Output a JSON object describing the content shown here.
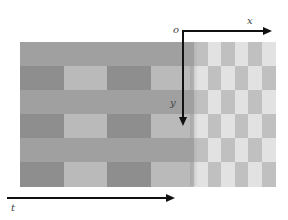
{
  "diagram": {
    "labels": {
      "origin": "o",
      "x_axis": "x",
      "y_axis": "y",
      "time_axis": "t"
    },
    "colors": {
      "stripe_mid": "#a0a0a0",
      "block_dark": "#8e8e8e",
      "block_light": "#bababa",
      "fine_dark": "#c0c0c0",
      "fine_light": "#e2e2e2",
      "transition": "#b0b0b0",
      "axis": "#111111"
    },
    "grid": {
      "rows": 6,
      "coarse_columns": 4,
      "fine_columns": 6,
      "coarse_pattern": [
        [
          "mid",
          "mid",
          "mid",
          "mid"
        ],
        [
          "dark",
          "light",
          "dark",
          "light"
        ],
        [
          "mid",
          "mid",
          "mid",
          "mid"
        ],
        [
          "dark",
          "light",
          "dark",
          "light"
        ],
        [
          "mid",
          "mid",
          "mid",
          "mid"
        ],
        [
          "dark",
          "light",
          "dark",
          "light"
        ]
      ],
      "fine_pattern": [
        [
          "dark",
          "light",
          "dark",
          "light",
          "dark",
          "light"
        ],
        [
          "light",
          "dark",
          "light",
          "dark",
          "light",
          "dark"
        ],
        [
          "dark",
          "light",
          "dark",
          "light",
          "dark",
          "light"
        ],
        [
          "light",
          "dark",
          "light",
          "dark",
          "light",
          "dark"
        ],
        [
          "dark",
          "light",
          "dark",
          "light",
          "dark",
          "light"
        ],
        [
          "light",
          "dark",
          "light",
          "dark",
          "light",
          "dark"
        ]
      ]
    }
  }
}
